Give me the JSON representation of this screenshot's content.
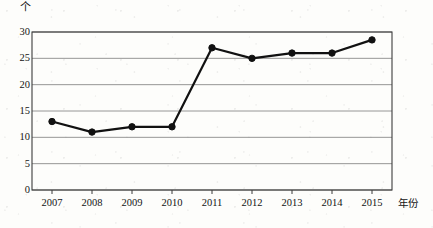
{
  "chart_data": {
    "type": "line",
    "title": "",
    "subtitle": "",
    "xlabel": "年份",
    "ylabel": "个",
    "categories": [
      "2007",
      "2008",
      "2009",
      "2010",
      "2011",
      "2012",
      "2013",
      "2014",
      "2015"
    ],
    "values": [
      13,
      11,
      12,
      12,
      27,
      25,
      26,
      26,
      28.5
    ],
    "series": [
      {
        "name": "",
        "values": [
          13,
          11,
          12,
          12,
          27,
          25,
          26,
          26,
          28.5
        ]
      }
    ],
    "ylim": [
      0,
      30
    ],
    "yticks": [
      "0",
      "5",
      "10",
      "15",
      "20",
      "25",
      "30"
    ],
    "ytick_values": [
      0,
      5,
      10,
      15,
      20,
      25,
      30
    ],
    "xtick_labels": [
      "2007",
      "2008",
      "2009",
      "2010",
      "2011",
      "2012",
      "2013",
      "2014",
      "2015"
    ],
    "grid": true,
    "grid_axis": "y",
    "legend": false,
    "legend_position": "none",
    "marker": "filled-circle",
    "line_color": "#111111",
    "marker_color": "#111111",
    "grid_color": "#8a8a8a",
    "axis_color": "#4a4a4a",
    "background": "#ffffff"
  }
}
